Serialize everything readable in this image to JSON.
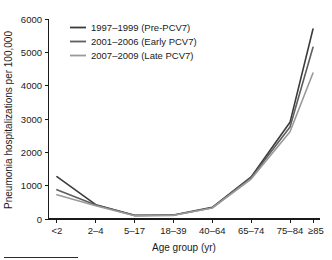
{
  "chart_data": {
    "type": "line",
    "title": "",
    "xlabel": "Age group (yr)",
    "ylabel": "Pneumonia hospitalizations per 100,000",
    "categories": [
      "<2",
      "2–4",
      "5–17",
      "18–39",
      "40–64",
      "65–74",
      "75–84",
      "≥85"
    ],
    "ylim": [
      0,
      6000
    ],
    "yticks": [
      0,
      1000,
      2000,
      3000,
      4000,
      5000,
      6000
    ],
    "ytick_labels": [
      "0",
      "1000",
      "2000",
      "3000",
      "4000",
      "5000",
      "6000"
    ],
    "grid": false,
    "legend_position": "upper-left",
    "series": [
      {
        "name": "1997–1999 (Pre-PCV7)",
        "color": "#3b3b3b",
        "values": [
          1270,
          430,
          110,
          120,
          350,
          1260,
          2900,
          5700
        ]
      },
      {
        "name": "2001–2006 (Early PCV7)",
        "color": "#5e5e5e",
        "values": [
          880,
          420,
          105,
          115,
          340,
          1240,
          2760,
          5150
        ]
      },
      {
        "name": "2007–2009 (Late PCV7)",
        "color": "#9a9a9a",
        "values": [
          730,
          400,
          100,
          110,
          330,
          1200,
          2620,
          4380
        ]
      }
    ]
  },
  "legend": {
    "entries": [
      {
        "label": "1997–1999 (Pre-PCV7)"
      },
      {
        "label": "2001–2006 (Early PCV7)"
      },
      {
        "label": "2007–2009 (Late PCV7)"
      }
    ]
  },
  "axes": {
    "x_title": "Age group (yr)",
    "y_title": "Pneumonia hospitalizations per 100,000"
  }
}
